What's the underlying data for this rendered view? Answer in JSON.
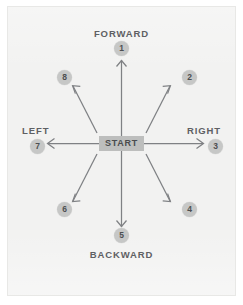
{
  "diagram": {
    "center_label": "START",
    "colors": {
      "background": "#f2f2f1",
      "page": "#ffffff",
      "arrow": "#7f8184",
      "badge_fill": "#c6c7c6",
      "badge_text": "#4d4f51",
      "label_text": "#5e6063",
      "start_fill": "#bdbebd",
      "start_text": "#4a4c4e"
    },
    "direction_labels": {
      "forward": "FORWARD",
      "backward": "BACKWARD",
      "left": "LEFT",
      "right": "RIGHT"
    },
    "badges": [
      {
        "number": "1",
        "direction": "forward"
      },
      {
        "number": "2",
        "direction": "forward-right"
      },
      {
        "number": "3",
        "direction": "right"
      },
      {
        "number": "4",
        "direction": "backward-right"
      },
      {
        "number": "5",
        "direction": "backward"
      },
      {
        "number": "6",
        "direction": "backward-left"
      },
      {
        "number": "7",
        "direction": "left"
      },
      {
        "number": "8",
        "direction": "forward-left"
      }
    ]
  }
}
